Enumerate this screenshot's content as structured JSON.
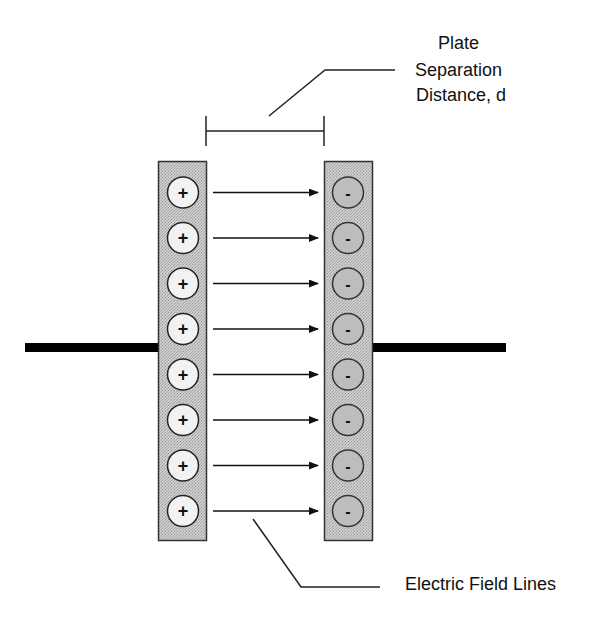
{
  "diagram": {
    "labels": {
      "plate_separation": [
        "Plate",
        "Separation",
        "Distance, d"
      ],
      "field_lines": "Electric Field Lines"
    },
    "positive_plate": {
      "charge_symbol": "+",
      "charge_count": 8
    },
    "negative_plate": {
      "charge_symbol": "-",
      "charge_count": 8
    },
    "field_arrow_count": 8,
    "colors": {
      "plate_fill": "#c4c4c4",
      "plate_stroke": "#333333",
      "positive_charge_fill": "#f2f2f2",
      "negative_charge_fill": "#bdbdbd",
      "wire": "#000000",
      "line": "#222222"
    }
  }
}
